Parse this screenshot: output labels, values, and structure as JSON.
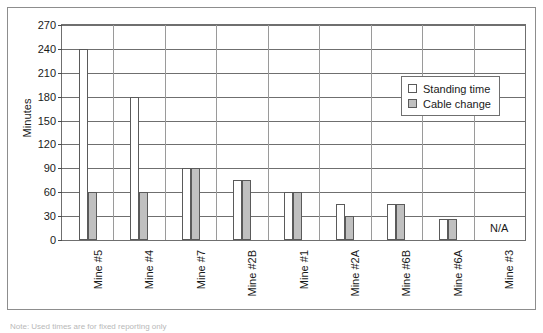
{
  "chart_data": {
    "type": "bar",
    "title": "",
    "xlabel": "",
    "ylabel": "Minutes",
    "ylim": [
      0,
      270
    ],
    "ytick_step": 30,
    "yticks": [
      0,
      30,
      60,
      90,
      120,
      150,
      180,
      210,
      240,
      270
    ],
    "grid": true,
    "legend_position": "upper-right",
    "categories": [
      "Mine #5",
      "Mine #4",
      "Mine #7",
      "Mine #2B",
      "Mine #1",
      "Mine #2A",
      "Mine #6B",
      "Mine #6A",
      "Mine #3"
    ],
    "series": [
      {
        "name": "Standing time",
        "color": "#ffffff",
        "values": [
          240,
          180,
          90,
          75,
          60,
          45,
          45,
          27,
          null
        ]
      },
      {
        "name": "Cable change",
        "color": "#c0c0c0",
        "values": [
          60,
          60,
          90,
          75,
          60,
          30,
          45,
          27,
          null
        ]
      }
    ],
    "annotations": [
      {
        "category": "Mine #3",
        "text": "N/A"
      }
    ]
  },
  "axis": {
    "y_title": "Minutes",
    "y_tick_labels": [
      "270",
      "240",
      "210",
      "180",
      "150",
      "120",
      "90",
      "60",
      "30",
      "0"
    ]
  },
  "legend": {
    "items": [
      {
        "label": "Standing time",
        "swatch": "standing"
      },
      {
        "label": "Cable change",
        "swatch": "cable"
      }
    ]
  },
  "annotations": {
    "na_label": "N/A"
  },
  "caption": {
    "text": "Note: Used times are for fixed reporting only"
  }
}
